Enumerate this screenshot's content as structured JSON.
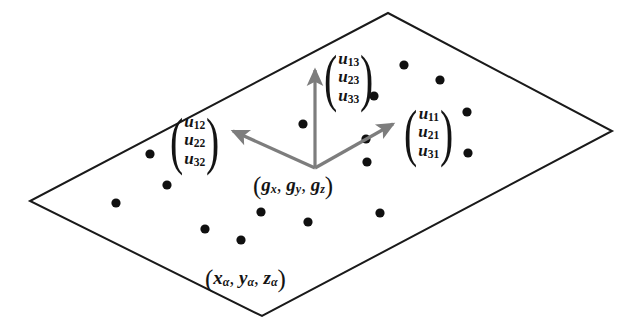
{
  "figure": {
    "background_color": "#ffffff",
    "outline_color": "#1a1a1a",
    "arrow_color": "#7d7d7d",
    "dot_color": "#101010",
    "plane": {
      "name": "lattice-plane-parallelogram",
      "corners": [
        {
          "x": 388,
          "y": 13
        },
        {
          "x": 612,
          "y": 131
        },
        {
          "x": 262,
          "y": 316
        },
        {
          "x": 30,
          "y": 201
        }
      ],
      "stroke_width": 2.0
    },
    "dots": {
      "radius": 4.6,
      "points": [
        {
          "x": 404,
          "y": 65
        },
        {
          "x": 440,
          "y": 80
        },
        {
          "x": 374,
          "y": 96
        },
        {
          "x": 467,
          "y": 112
        },
        {
          "x": 150,
          "y": 154
        },
        {
          "x": 366,
          "y": 139
        },
        {
          "x": 468,
          "y": 153
        },
        {
          "x": 167,
          "y": 185
        },
        {
          "x": 303,
          "y": 124
        },
        {
          "x": 116,
          "y": 203
        },
        {
          "x": 367,
          "y": 162
        },
        {
          "x": 205,
          "y": 229
        },
        {
          "x": 241,
          "y": 240
        },
        {
          "x": 308,
          "y": 222
        },
        {
          "x": 380,
          "y": 213
        },
        {
          "x": 261,
          "y": 212
        }
      ]
    },
    "vectors": [
      {
        "name": "vector-arrow-u3",
        "direction": "up",
        "origin": {
          "x": 315,
          "y": 168
        },
        "tip": {
          "x": 315,
          "y": 70
        }
      },
      {
        "name": "vector-arrow-u2",
        "direction": "upper-left",
        "origin": {
          "x": 315,
          "y": 168
        },
        "tip": {
          "x": 233,
          "y": 131
        }
      },
      {
        "name": "vector-arrow-u1",
        "direction": "upper-right",
        "origin": {
          "x": 315,
          "y": 168
        },
        "tip": {
          "x": 393,
          "y": 124
        }
      }
    ],
    "vector_labels": [
      {
        "name": "column-vector-u-col2",
        "left": 166,
        "top": 113,
        "entries": [
          {
            "base": "u",
            "sub": "12"
          },
          {
            "base": "u",
            "sub": "22"
          },
          {
            "base": "u",
            "sub": "32"
          }
        ]
      },
      {
        "name": "column-vector-u-col3",
        "left": 320,
        "top": 50,
        "entries": [
          {
            "base": "u",
            "sub": "13"
          },
          {
            "base": "u",
            "sub": "23"
          },
          {
            "base": "u",
            "sub": "33"
          }
        ]
      },
      {
        "name": "column-vector-u-col1",
        "left": 400,
        "top": 105,
        "entries": [
          {
            "base": "u",
            "sub": "11"
          },
          {
            "base": "u",
            "sub": "21"
          },
          {
            "base": "u",
            "sub": "31"
          }
        ]
      }
    ],
    "coordinate_labels": [
      {
        "name": "origin-coordinate-label",
        "left": 253,
        "top": 172,
        "open": "(",
        "close": ")",
        "parts": [
          {
            "base": "g",
            "sub": "x",
            "sep": ", "
          },
          {
            "base": "g",
            "sub": "y",
            "sep": ", "
          },
          {
            "base": "g",
            "sub": "z",
            "sep": ""
          }
        ]
      },
      {
        "name": "atom-coordinate-label",
        "left": 205,
        "top": 265,
        "open": "(",
        "close": ")",
        "parts": [
          {
            "base": "x",
            "sub": "α",
            "sep": ", "
          },
          {
            "base": "y",
            "sub": "α",
            "sep": ", "
          },
          {
            "base": "z",
            "sub": "α",
            "sep": ""
          }
        ]
      }
    ]
  }
}
